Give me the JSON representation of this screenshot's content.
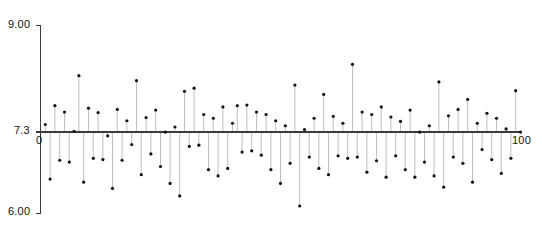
{
  "chart_data": {
    "type": "line",
    "plot_style": "stem",
    "title": "",
    "xlabel": "",
    "ylabel": "",
    "xlim": [
      0,
      100
    ],
    "ylim": [
      6.0,
      9.0
    ],
    "baseline": 7.3,
    "grid": false,
    "legend": null,
    "y_ticks": [
      {
        "value": 9.0,
        "label": "9.00"
      },
      {
        "value": 7.3,
        "label": "7.3"
      },
      {
        "value": 6.0,
        "label": "6.00"
      }
    ],
    "x_ticks": [
      {
        "value": 0,
        "label": "0"
      },
      {
        "value": 100,
        "label": "100"
      }
    ],
    "marker": {
      "shape": "circle",
      "color": "#111111",
      "size_px": 3.2
    },
    "stem": {
      "color": "#b8b8b8",
      "width_px": 0.9
    },
    "axis": {
      "color": "#3a3a3a",
      "width_px": 1.2
    },
    "n_points": 100,
    "x": [
      1,
      2,
      3,
      4,
      5,
      6,
      7,
      8,
      9,
      10,
      11,
      12,
      13,
      14,
      15,
      16,
      17,
      18,
      19,
      20,
      21,
      22,
      23,
      24,
      25,
      26,
      27,
      28,
      29,
      30,
      31,
      32,
      33,
      34,
      35,
      36,
      37,
      38,
      39,
      40,
      41,
      42,
      43,
      44,
      45,
      46,
      47,
      48,
      49,
      50,
      51,
      52,
      53,
      54,
      55,
      56,
      57,
      58,
      59,
      60,
      61,
      62,
      63,
      64,
      65,
      66,
      67,
      68,
      69,
      70,
      71,
      72,
      73,
      74,
      75,
      76,
      77,
      78,
      79,
      80,
      81,
      82,
      83,
      84,
      85,
      86,
      87,
      88,
      89,
      90,
      91,
      92,
      93,
      94,
      95,
      96,
      97,
      98,
      99,
      100
    ],
    "values": [
      7.42,
      6.55,
      7.72,
      6.85,
      7.62,
      6.82,
      7.31,
      8.2,
      6.5,
      7.68,
      6.88,
      7.61,
      6.86,
      7.24,
      6.4,
      7.66,
      6.85,
      7.48,
      7.1,
      8.12,
      6.62,
      7.53,
      6.95,
      7.65,
      6.75,
      7.3,
      6.48,
      7.38,
      6.28,
      7.95,
      7.07,
      8.0,
      7.09,
      7.58,
      6.7,
      7.52,
      6.6,
      7.7,
      6.72,
      7.44,
      7.72,
      6.98,
      7.73,
      7.0,
      7.62,
      6.93,
      7.58,
      6.7,
      7.48,
      6.48,
      7.4,
      6.8,
      8.05,
      6.12,
      7.34,
      6.9,
      7.52,
      6.72,
      7.9,
      6.62,
      7.55,
      6.92,
      7.44,
      6.88,
      8.38,
      6.9,
      7.62,
      6.66,
      7.58,
      6.84,
      7.7,
      6.58,
      7.54,
      6.92,
      7.47,
      6.7,
      7.65,
      6.58,
      7.3,
      6.82,
      7.4,
      6.6,
      8.1,
      6.42,
      7.56,
      6.9,
      7.66,
      6.8,
      7.82,
      6.5,
      7.44,
      7.02,
      7.6,
      6.86,
      7.52,
      6.64,
      7.35,
      6.88,
      7.96,
      7.3
    ]
  }
}
